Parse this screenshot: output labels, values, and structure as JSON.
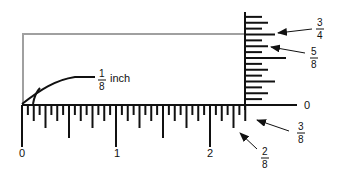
{
  "diagram": {
    "unit_label": "inch",
    "colors": {
      "ink": "#111111",
      "guide": "#a0a0a0",
      "background": "#ffffff"
    },
    "horizontal_ruler": {
      "major_labels": [
        "0",
        "1",
        "2"
      ],
      "inches": 2.375,
      "subdivision": 16
    },
    "vertical_ruler": {
      "zero_label": "0",
      "inches": 0.9375,
      "subdivision": 16
    },
    "callouts": [
      {
        "id": "one-eighth-inch",
        "numerator": "1",
        "denominator": "8",
        "suffix": "inch"
      },
      {
        "id": "three-quarters",
        "numerator": "3",
        "denominator": "4"
      },
      {
        "id": "five-eighths",
        "numerator": "5",
        "denominator": "8"
      },
      {
        "id": "three-eighths",
        "numerator": "3",
        "denominator": "8"
      },
      {
        "id": "two-eighths",
        "numerator": "2",
        "denominator": "8"
      }
    ]
  }
}
